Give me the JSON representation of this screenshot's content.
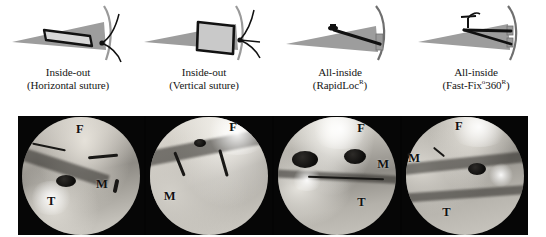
{
  "figure": {
    "colors": {
      "cone_gray": "#9c9c9c",
      "device_gray": "#b3b3b3",
      "outline_black": "#111111",
      "photo_background": "#040404",
      "caption_text": "#161616"
    }
  },
  "schematics": [
    {
      "id": "inside-out-horizontal",
      "technique": "Inside-out",
      "variant": "(Horizontal suture)",
      "caption_line1": "Inside-out",
      "caption_line2": "(Horizontal suture)",
      "registered_mark": false
    },
    {
      "id": "inside-out-vertical",
      "technique": "Inside-out",
      "variant": "(Vertical suture)",
      "caption_line1": "Inside-out",
      "caption_line2": "(Vertical suture)",
      "registered_mark": false
    },
    {
      "id": "all-inside-rapidloc",
      "technique": "All-inside",
      "variant": "(RapidLoc®)",
      "caption_line1": "All-inside",
      "caption_line2_pre": "(RapidLoc",
      "caption_line2_reg": "R",
      "caption_line2_post": ")",
      "registered_mark": true
    },
    {
      "id": "all-inside-fastfix360",
      "technique": "All-inside",
      "variant": "(Fast-Fix®360®)",
      "caption_line1": "All-inside",
      "caption_line2_pre": "(Fast-Fix",
      "caption_line2_reg1": "o",
      "caption_line2_mid": "360",
      "caption_line2_reg2": "R",
      "caption_line2_post": ")",
      "registered_mark": true
    }
  ],
  "photo_panels": [
    {
      "id": "panel-1",
      "corresponds_to": "inside-out-horizontal",
      "annotations": [
        {
          "label": "F",
          "meaning": "femur",
          "x": "46%",
          "y": "6%"
        },
        {
          "label": "M",
          "meaning": "meniscus",
          "x": "62%",
          "y": "52%"
        },
        {
          "label": "T",
          "meaning": "tibia",
          "x": "23%",
          "y": "66%"
        }
      ]
    },
    {
      "id": "panel-2",
      "corresponds_to": "inside-out-vertical",
      "annotations": [
        {
          "label": "F",
          "meaning": "femur",
          "x": "66%",
          "y": "4%"
        },
        {
          "label": "M",
          "meaning": "meniscus",
          "x": "14%",
          "y": "62%"
        }
      ]
    },
    {
      "id": "panel-3",
      "corresponds_to": "all-inside-rapidloc",
      "annotations": [
        {
          "label": "F",
          "meaning": "femur",
          "x": "66%",
          "y": "5%"
        },
        {
          "label": "M",
          "meaning": "meniscus",
          "x": "82%",
          "y": "35%"
        },
        {
          "label": "T",
          "meaning": "tibia",
          "x": "66%",
          "y": "67%"
        }
      ]
    },
    {
      "id": "panel-4",
      "corresponds_to": "all-inside-fastfix360",
      "annotations": [
        {
          "label": "F",
          "meaning": "femur",
          "x": "42%",
          "y": "3%"
        },
        {
          "label": "M",
          "meaning": "meniscus",
          "x": "5%",
          "y": "30%"
        },
        {
          "label": "T",
          "meaning": "tibia",
          "x": "32%",
          "y": "76%"
        }
      ]
    }
  ]
}
